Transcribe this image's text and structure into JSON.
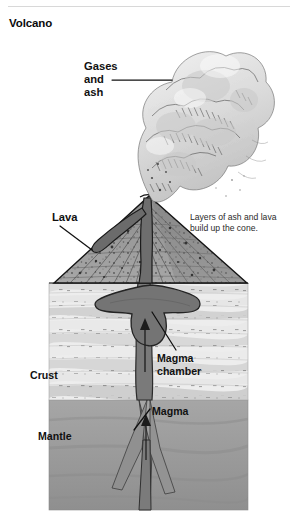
{
  "page": {
    "title": "Volcano",
    "background_color": "#ffffff",
    "divider_color": "#d8d8d8"
  },
  "figure": {
    "type": "cross-section-diagram",
    "subject": "volcano",
    "style": "grayscale pen-and-ink textbook illustration",
    "labels": [
      {
        "id": "gases-and-ash",
        "lines": [
          "Gases",
          "and",
          "ash"
        ],
        "line1": "Gases",
        "line2": "and",
        "line3": "ash",
        "x": 84,
        "y": 66,
        "leader": true
      },
      {
        "id": "lava",
        "lines": [
          "Lava"
        ],
        "line1": "Lava",
        "x": 52,
        "y": 219,
        "leader": true
      },
      {
        "id": "magma-chamber",
        "lines": [
          "Magma",
          "chamber"
        ],
        "line1": "Magma",
        "line2": "chamber",
        "x": 157,
        "y": 358,
        "leader": true
      },
      {
        "id": "crust",
        "lines": [
          "Crust"
        ],
        "line1": "Crust",
        "x": 30,
        "y": 376,
        "leader": false
      },
      {
        "id": "magma",
        "lines": [
          "Magma"
        ],
        "line1": "Magma",
        "x": 152,
        "y": 412,
        "leader": true
      },
      {
        "id": "mantle",
        "lines": [
          "Mantle"
        ],
        "line1": "Mantle",
        "x": 38,
        "y": 437,
        "leader": false
      }
    ],
    "caption": {
      "id": "cone-caption",
      "line1": "Layers of ash and lava",
      "line2": "build up the cone.",
      "x": 190,
      "y": 220
    },
    "colors": {
      "ash_cloud": "#dcdcdc",
      "cone_fill": "#9a9a9a",
      "conduit": "#6f6f6f",
      "crust_light": "#e8e8e8",
      "crust_mid": "#cfcfcf",
      "mantle": "#9e9e9e",
      "outline": "#1a1a1a"
    },
    "regions": [
      {
        "name": "ash-plume",
        "label": "Gases and ash"
      },
      {
        "name": "volcano-cone",
        "label": "Layers of ash and lava"
      },
      {
        "name": "crust-layers",
        "label": "Crust"
      },
      {
        "name": "magma-chamber",
        "label": "Magma chamber"
      },
      {
        "name": "conduit",
        "label": "Magma"
      },
      {
        "name": "mantle-layer",
        "label": "Mantle"
      }
    ]
  }
}
